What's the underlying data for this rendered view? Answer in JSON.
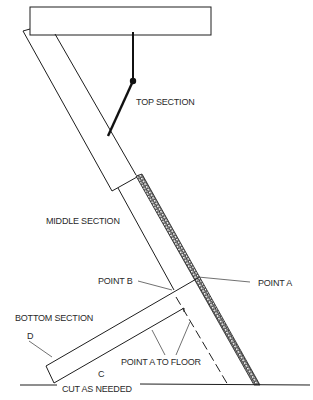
{
  "diagram": {
    "labels": {
      "top_section": "TOP SECTION",
      "middle_section": "MIDDLE SECTION",
      "point_b": "POINT B",
      "point_a": "POINT A",
      "bottom_section": "BOTTOM SECTION",
      "d": "D",
      "point_a_to_floor": "POINT A TO FLOOR",
      "c": "C",
      "cut_as_needed": "CUT AS NEEDED"
    },
    "colors": {
      "line": "#1e1e1e",
      "background": "#ffffff"
    }
  }
}
